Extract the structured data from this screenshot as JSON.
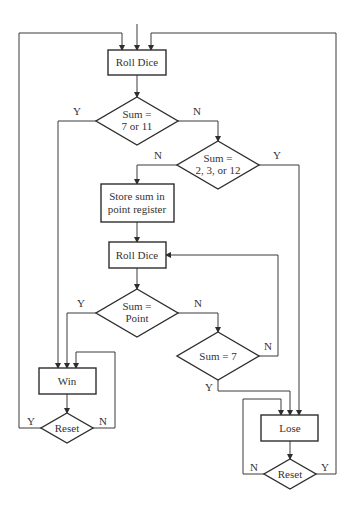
{
  "diagram": {
    "type": "flowchart",
    "title": "",
    "nodes": {
      "roll1": {
        "kind": "process",
        "text": "Roll Dice"
      },
      "dec1": {
        "kind": "decision",
        "line1": "Sum =",
        "line2": "7 or 11"
      },
      "dec2": {
        "kind": "decision",
        "line1": "Sum =",
        "line2": "2, 3, or 12"
      },
      "store": {
        "kind": "process",
        "line1": "Store sum in",
        "line2": "point register"
      },
      "roll2": {
        "kind": "process",
        "text": "Roll Dice"
      },
      "dec3": {
        "kind": "decision",
        "line1": "Sum =",
        "line2": "Point"
      },
      "dec4": {
        "kind": "decision",
        "text": "Sum = 7"
      },
      "win": {
        "kind": "process",
        "text": "Win"
      },
      "reset1": {
        "kind": "decision",
        "text": "Reset"
      },
      "lose": {
        "kind": "process",
        "text": "Lose"
      },
      "reset2": {
        "kind": "decision",
        "text": "Reset"
      }
    },
    "labels": {
      "dec1_yes": "Y",
      "dec1_no": "N",
      "dec2_no": "N",
      "dec2_yes": "Y",
      "dec3_yes": "Y",
      "dec3_no": "N",
      "dec4_no": "N",
      "dec4_yes": "Y",
      "reset1_yes": "Y",
      "reset1_no": "N",
      "reset2_no": "N",
      "reset2_yes": "Y"
    },
    "edges": [
      {
        "from": "start",
        "to": "roll1"
      },
      {
        "from": "roll1",
        "to": "dec1"
      },
      {
        "from": "dec1",
        "to": "win",
        "label": "Y"
      },
      {
        "from": "dec1",
        "to": "dec2",
        "label": "N"
      },
      {
        "from": "dec2",
        "to": "store",
        "label": "N"
      },
      {
        "from": "dec2",
        "to": "lose",
        "label": "Y"
      },
      {
        "from": "store",
        "to": "roll2"
      },
      {
        "from": "roll2",
        "to": "dec3"
      },
      {
        "from": "dec3",
        "to": "win",
        "label": "Y"
      },
      {
        "from": "dec3",
        "to": "dec4",
        "label": "N"
      },
      {
        "from": "dec4",
        "to": "roll2",
        "label": "N"
      },
      {
        "from": "dec4",
        "to": "lose",
        "label": "Y"
      },
      {
        "from": "win",
        "to": "reset1"
      },
      {
        "from": "reset1",
        "to": "roll1",
        "label": "Y"
      },
      {
        "from": "reset1",
        "to": "win",
        "label": "N"
      },
      {
        "from": "lose",
        "to": "reset2"
      },
      {
        "from": "reset2",
        "to": "lose",
        "label": "N"
      },
      {
        "from": "reset2",
        "to": "roll1",
        "label": "Y"
      }
    ]
  }
}
